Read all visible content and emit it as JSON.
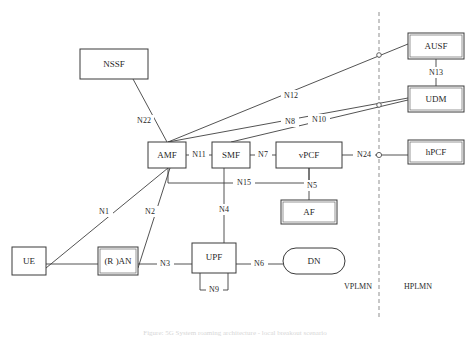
{
  "diagram": {
    "nodes": [
      {
        "id": "nssf",
        "label": "NSSF",
        "shape": "rect",
        "x": 80,
        "y": 49,
        "w": 68,
        "h": 30
      },
      {
        "id": "amf",
        "label": "AMF",
        "shape": "rect",
        "x": 148,
        "y": 142,
        "w": 38,
        "h": 26
      },
      {
        "id": "smf",
        "label": "SMF",
        "shape": "rect",
        "x": 212,
        "y": 142,
        "w": 38,
        "h": 26
      },
      {
        "id": "vpcf",
        "label": "vPCF",
        "shape": "rect",
        "x": 276,
        "y": 142,
        "w": 66,
        "h": 26
      },
      {
        "id": "hpcf",
        "label": "hPCF",
        "shape": "rect-dbl",
        "x": 408,
        "y": 140,
        "w": 56,
        "h": 24
      },
      {
        "id": "ausf",
        "label": "AUSF",
        "shape": "rect-dbl",
        "x": 408,
        "y": 33,
        "w": 56,
        "h": 26
      },
      {
        "id": "udm",
        "label": "UDM",
        "shape": "rect-dbl",
        "x": 408,
        "y": 86,
        "w": 56,
        "h": 26
      },
      {
        "id": "af",
        "label": "AF",
        "shape": "rect-dbl",
        "x": 281,
        "y": 200,
        "w": 56,
        "h": 24
      },
      {
        "id": "ue",
        "label": "UE",
        "shape": "rect",
        "x": 12,
        "y": 247,
        "w": 34,
        "h": 28
      },
      {
        "id": "ran",
        "label": "(R )AN",
        "shape": "rect-dbl",
        "x": 98,
        "y": 247,
        "w": 40,
        "h": 28
      },
      {
        "id": "upf",
        "label": "UPF",
        "shape": "rect",
        "x": 192,
        "y": 243,
        "w": 44,
        "h": 30
      },
      {
        "id": "dn",
        "label": "DN",
        "shape": "stadium",
        "x": 283,
        "y": 248,
        "w": 62,
        "h": 26
      }
    ],
    "links": [
      {
        "id": "n22",
        "label": "N22",
        "from": "nssf",
        "to": "amf",
        "label_x": 144,
        "label_y": 121
      },
      {
        "id": "n12",
        "label": "N12",
        "from": "amf",
        "to": "ausf",
        "label_x": 291,
        "label_y": 96
      },
      {
        "id": "n8",
        "label": "N8",
        "from": "amf",
        "to": "udm",
        "label_x": 290,
        "label_y": 122
      },
      {
        "id": "n10",
        "label": "N10",
        "from": "smf",
        "to": "udm",
        "label_x": 319,
        "label_y": 120
      },
      {
        "id": "n13",
        "label": "N13",
        "from": "ausf",
        "to": "udm",
        "label_x": 436,
        "label_y": 73
      },
      {
        "id": "n11",
        "label": "N11",
        "from": "amf",
        "to": "smf",
        "label_x": 199,
        "label_y": 155
      },
      {
        "id": "n7",
        "label": "N7",
        "from": "smf",
        "to": "vpcf",
        "label_x": 263,
        "label_y": 155
      },
      {
        "id": "n24",
        "label": "N24",
        "from": "vpcf",
        "to": "hpcf",
        "label_x": 364,
        "label_y": 155
      },
      {
        "id": "n15",
        "label": "N15",
        "from": "amf",
        "to": "vpcf",
        "label_x": 244,
        "label_y": 183
      },
      {
        "id": "n5",
        "label": "N5",
        "from": "vpcf",
        "to": "af",
        "label_x": 312,
        "label_y": 186
      },
      {
        "id": "n4",
        "label": "N4",
        "from": "smf",
        "to": "upf",
        "label_x": 224,
        "label_y": 210
      },
      {
        "id": "n1",
        "label": "N1",
        "from": "ue",
        "to": "amf",
        "label_x": 104,
        "label_y": 212
      },
      {
        "id": "n2",
        "label": "N2",
        "from": "ran",
        "to": "amf",
        "label_x": 150,
        "label_y": 212
      },
      {
        "id": "n3",
        "label": "N3",
        "from": "ran",
        "to": "upf",
        "label_x": 165,
        "label_y": 264
      },
      {
        "id": "n6",
        "label": "N6",
        "from": "upf",
        "to": "dn",
        "label_x": 259,
        "label_y": 264
      },
      {
        "id": "n9",
        "label": "N9",
        "from": "upf",
        "to": "upf",
        "label_x": 214,
        "label_y": 290
      }
    ],
    "boundary": {
      "name": "plmn-boundary",
      "x": 379,
      "y_top": 12,
      "y_bottom": 320
    },
    "plmn_labels": [
      {
        "id": "vplmn",
        "label": "VPLMN",
        "x": 358,
        "y": 287
      },
      {
        "id": "hplmn",
        "label": "HPLMN",
        "x": 418,
        "y": 287
      }
    ],
    "caption": "Figure: 5G System roaming architecture - local breakout scenario"
  }
}
